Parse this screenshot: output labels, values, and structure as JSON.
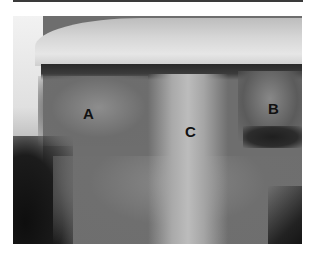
{
  "figure": {
    "labels": [
      {
        "id": "A",
        "text": "A",
        "x": 83,
        "y": 106
      },
      {
        "id": "B",
        "text": "B",
        "x": 268,
        "y": 101
      },
      {
        "id": "C",
        "text": "C",
        "x": 185,
        "y": 124
      }
    ]
  }
}
